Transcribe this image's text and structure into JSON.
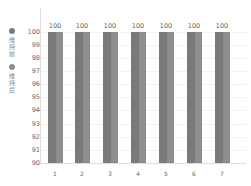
{
  "chart_data": {
    "type": "bar",
    "title": "",
    "xlabel": "",
    "ylabel": "",
    "categories": [
      "1",
      "2",
      "3",
      "4",
      "5",
      "6",
      "7"
    ],
    "series": [
      {
        "name": "维持前",
        "values": [
          100,
          100,
          100,
          100,
          100,
          100,
          100
        ],
        "color": "#7a7a7a"
      },
      {
        "name": "维持后",
        "values": [
          100,
          100,
          100,
          100,
          100,
          100,
          100
        ],
        "color": "#8e8e8e"
      }
    ],
    "data_labels": [
      "100",
      "100",
      "100",
      "100",
      "100",
      "100",
      "100"
    ],
    "ylim": [
      90,
      100
    ],
    "yticks": [
      "100",
      "99",
      "98",
      "97",
      "96",
      "95",
      "94",
      "93",
      "92",
      "91",
      "90"
    ],
    "grid": true,
    "legend_position": "left"
  },
  "legend": {
    "items": [
      {
        "label": "维持前",
        "color": "#7a7a7a"
      },
      {
        "label": "维持后",
        "color": "#8e8e8e"
      }
    ]
  }
}
